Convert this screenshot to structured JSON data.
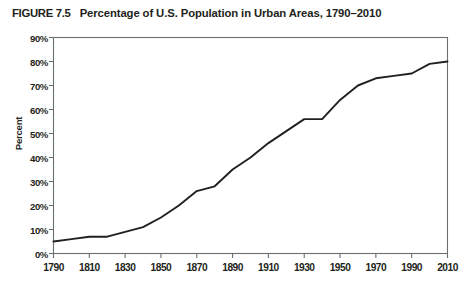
{
  "figure": {
    "label": "FIGURE 7.5",
    "title": "Percentage of U.S. Population in Urban Areas, 1790–2010",
    "full_title": "FIGURE 7.5  Percentage of U.S. Population in Urban Areas, 1790–2010"
  },
  "colors": {
    "line": "#231f20",
    "axis": "#6d6e71",
    "text": "#231f20",
    "background": "#ffffff"
  },
  "chart_data": {
    "type": "line",
    "title": "Percentage of U.S. Population in Urban Areas, 1790–2010",
    "xlabel": "",
    "ylabel": "Percent",
    "xlim": [
      1790,
      2010
    ],
    "ylim": [
      0,
      90
    ],
    "grid": false,
    "legend": false,
    "y_tick_labels": [
      "90%",
      "80%",
      "70%",
      "60%",
      "50%",
      "40%",
      "30%",
      "20%",
      "10%",
      "0%"
    ],
    "y_ticks": [
      90,
      80,
      70,
      60,
      50,
      40,
      30,
      20,
      10,
      0
    ],
    "x_tick_labels": [
      "1790",
      "1810",
      "1830",
      "1850",
      "1870",
      "1890",
      "1910",
      "1930",
      "1950",
      "1970",
      "1990",
      "2010"
    ],
    "x_ticks": [
      1790,
      1810,
      1830,
      1850,
      1870,
      1890,
      1910,
      1930,
      1950,
      1970,
      1990,
      2010
    ],
    "x": [
      1790,
      1800,
      1810,
      1820,
      1830,
      1840,
      1850,
      1860,
      1870,
      1880,
      1890,
      1900,
      1910,
      1920,
      1930,
      1940,
      1950,
      1960,
      1970,
      1980,
      1990,
      2000,
      2010
    ],
    "values": [
      5,
      6,
      7,
      7,
      9,
      11,
      15,
      20,
      26,
      28,
      35,
      40,
      46,
      51,
      56,
      56,
      64,
      70,
      73,
      74,
      75,
      79,
      80
    ],
    "series": [
      {
        "name": "Percent urban",
        "values": [
          5,
          6,
          7,
          7,
          9,
          11,
          15,
          20,
          26,
          28,
          35,
          40,
          46,
          51,
          56,
          56,
          64,
          70,
          73,
          74,
          75,
          79,
          80
        ]
      }
    ]
  }
}
